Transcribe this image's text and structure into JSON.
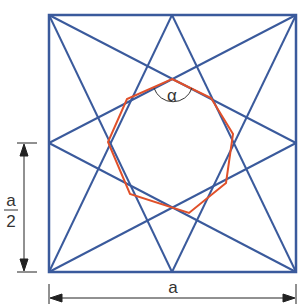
{
  "diagram": {
    "type": "geometric-construction",
    "labels": {
      "angle": "α",
      "half_side_numerator": "a",
      "half_side_denominator": "2",
      "side": "a"
    },
    "colors": {
      "square": "#3a5a9c",
      "star_lines": "#3a5a9c",
      "octagon": "#e0502a",
      "dimension": "#222222"
    },
    "square": {
      "x1": 49,
      "y1": 15,
      "x2": 296,
      "y2": 272
    },
    "octagon_points": "172,79 218,97 236,143 218,189 172,207 126,189 108,143 126,97"
  }
}
